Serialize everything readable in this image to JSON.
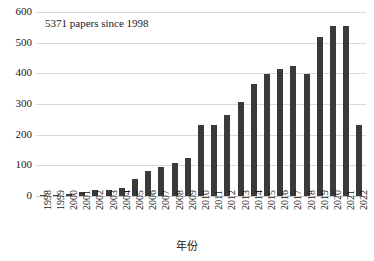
{
  "chart_data": {
    "type": "bar",
    "title": "",
    "annotation": "5371 papers since 1998",
    "xlabel": "年份",
    "ylabel": "",
    "ylim": [
      0,
      600
    ],
    "ytick_step": 100,
    "yticks": [
      "600",
      "500",
      "400",
      "300",
      "200",
      "100",
      "0"
    ],
    "grid": true,
    "legend": "none",
    "bar_color": "#3a3a3a",
    "grid_color": "#d9d9d9",
    "categories": [
      "1998",
      "1999",
      "2000",
      "2001",
      "2002",
      "2003",
      "2004",
      "2005",
      "2006",
      "2007",
      "2008",
      "2009",
      "2010",
      "2011",
      "2012",
      "2013",
      "2014",
      "2015",
      "2016",
      "2017",
      "2018",
      "2019",
      "2020",
      "2021",
      "2022"
    ],
    "values": [
      2,
      3,
      7,
      13,
      19,
      19,
      25,
      54,
      83,
      96,
      107,
      123,
      231,
      232,
      265,
      307,
      364,
      398,
      413,
      424,
      399,
      518,
      553,
      553,
      231
    ]
  }
}
